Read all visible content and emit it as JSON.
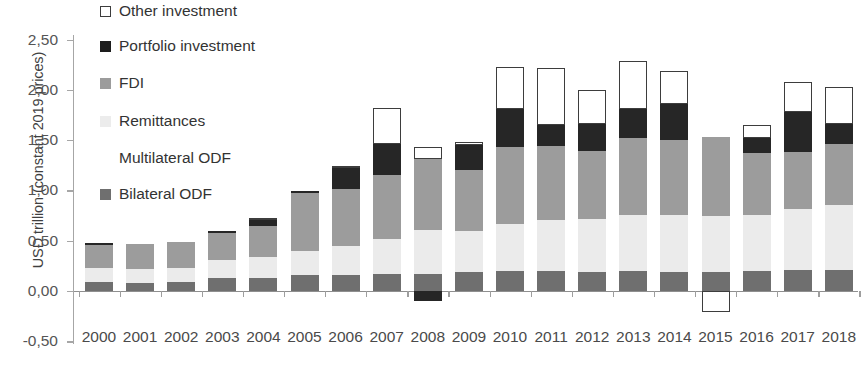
{
  "chart_data": {
    "type": "bar",
    "subtype": "stacked-bar",
    "title": "",
    "xlabel": "",
    "ylabel": "USD trillion (constant 2019 prices)",
    "ylim": [
      -0.5,
      2.5
    ],
    "ytick_labels": [
      "2,50",
      "2,00",
      "1,50",
      "1,00",
      "0,50",
      "0,00",
      "-0,50"
    ],
    "ytick_values": [
      2.5,
      2.0,
      1.5,
      1.0,
      0.5,
      0.0,
      -0.5
    ],
    "grid": false,
    "legend_position": "upper-left-inside",
    "decimal_separator": ",",
    "categories": [
      "2000",
      "2001",
      "2002",
      "2003",
      "2004",
      "2005",
      "2006",
      "2007",
      "2008",
      "2009",
      "2010",
      "2011",
      "2012",
      "2013",
      "2014",
      "2015",
      "2016",
      "2017",
      "2018"
    ],
    "series": [
      {
        "name": "Bilateral ODF",
        "color": "#6f6f6f",
        "values": [
          0.09,
          0.08,
          0.09,
          0.13,
          0.13,
          0.16,
          0.16,
          0.17,
          0.17,
          0.19,
          0.2,
          0.2,
          0.19,
          0.2,
          0.19,
          0.19,
          0.2,
          0.21,
          0.21
        ]
      },
      {
        "name": "Multilateral ODF",
        "color": "#8a8a8a",
        "values": [
          0.0,
          0.0,
          0.0,
          0.0,
          0.0,
          0.0,
          0.0,
          0.0,
          0.0,
          0.0,
          0.0,
          0.0,
          0.0,
          0.0,
          0.0,
          0.0,
          0.0,
          0.0,
          0.0
        ]
      },
      {
        "name": "Remittances",
        "color": "#ebebeb",
        "values": [
          0.14,
          0.14,
          0.14,
          0.18,
          0.21,
          0.24,
          0.29,
          0.35,
          0.44,
          0.41,
          0.47,
          0.51,
          0.53,
          0.56,
          0.57,
          0.56,
          0.56,
          0.61,
          0.64
        ]
      },
      {
        "name": "FDI",
        "color": "#9c9c9c",
        "values": [
          0.23,
          0.25,
          0.26,
          0.27,
          0.31,
          0.57,
          0.56,
          0.63,
          0.7,
          0.6,
          0.76,
          0.73,
          0.67,
          0.76,
          0.74,
          0.78,
          0.61,
          0.56,
          0.61
        ]
      },
      {
        "name": "Portfolio investment",
        "color": "#262626",
        "values": [
          0.02,
          0.0,
          0.0,
          0.02,
          0.06,
          0.02,
          0.21,
          0.31,
          -0.1,
          0.25,
          0.38,
          0.21,
          0.27,
          0.29,
          0.36,
          0.0,
          0.15,
          0.4,
          0.2
        ]
      },
      {
        "name": "Other investment",
        "color": "#ffffff",
        "values": [
          0.0,
          0.0,
          0.0,
          0.0,
          0.02,
          0.0,
          0.02,
          0.36,
          0.12,
          0.03,
          0.42,
          0.57,
          0.34,
          0.48,
          0.33,
          -0.21,
          0.13,
          0.3,
          0.37
        ]
      }
    ],
    "stack_totals": [
      0.48,
      0.47,
      0.49,
      0.6,
      0.73,
      0.99,
      1.24,
      1.82,
      1.43,
      1.48,
      2.23,
      2.22,
      2.0,
      2.29,
      2.19,
      1.53,
      1.65,
      2.08,
      2.03
    ],
    "notes": {
      "negative_portfolio_year": "2008",
      "negative_other_year": "2015"
    }
  },
  "legend": {
    "items": [
      {
        "label": "Other investment",
        "swatch": "sw-other"
      },
      {
        "label": "Portfolio investment",
        "swatch": "sw-portfolio"
      },
      {
        "label": "FDI",
        "swatch": "sw-fdi"
      },
      {
        "label": "Remittances",
        "swatch": "sw-remittances"
      },
      {
        "label": "Multilateral ODF",
        "swatch": "sw-multilateral"
      },
      {
        "label": "Bilateral ODF",
        "swatch": "sw-bilateral"
      }
    ]
  }
}
